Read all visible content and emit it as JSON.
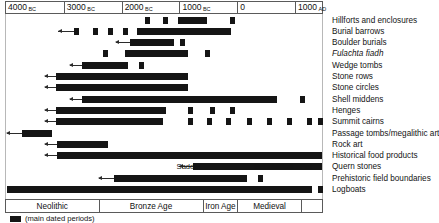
{
  "chart_data": {
    "type": "bar",
    "xlabel": "",
    "ylabel": "",
    "orientation": "horizontal-timeline",
    "grid": false,
    "legend_position": "bottom-left",
    "xlim": [
      -4000,
      1500
    ],
    "axis": {
      "ticks": [
        {
          "label": "4000",
          "era": "BC",
          "value": -4000
        },
        {
          "label": "3000",
          "era": "BC",
          "value": -3000
        },
        {
          "label": "2000",
          "era": "BC",
          "value": -2000
        },
        {
          "label": "1000",
          "era": "BC",
          "value": -1000
        },
        {
          "label": "0",
          "era": "",
          "value": 0
        },
        {
          "label": "1000",
          "era": "AD",
          "value": 1000
        }
      ]
    },
    "legend": [
      {
        "swatch": "solid-black",
        "label": "(main dated periods)"
      }
    ],
    "periods": [
      {
        "label": "Neolithic",
        "start": -4000,
        "end": -2400
      },
      {
        "label": "Bronze Age",
        "start": -2400,
        "end": -600
      },
      {
        "label": "Iron Age",
        "start": -600,
        "end": 0
      },
      {
        "label": "Medieval",
        "start": 0,
        "end": 1100
      },
      {
        "label": "",
        "start": 1100,
        "end": 1500
      }
    ],
    "annotations": [
      {
        "text": "Saddle",
        "value": -1050,
        "row": 13
      },
      {
        "text": "Beehive",
        "value": 300,
        "row": 13
      },
      {
        "text": "Disc",
        "value": 680,
        "row": 13
      },
      {
        "text": "&",
        "value": 880,
        "row": 13
      },
      {
        "text": "Pot",
        "value": 1090,
        "row": 13
      }
    ],
    "categories": [
      "Hillforts and enclosures",
      "Burial barrows",
      "Boulder burials",
      "Fulachta fiadh",
      "Wedge tombs",
      "Stone rows",
      "Stone circles",
      "Shell middens",
      "Henges",
      "Summit cairns",
      "Passage tombs/megalithic art",
      "Rock art",
      "Historical food products",
      "Quern stones",
      "Prehistoric field boundaries",
      "Logboats"
    ],
    "rows": [
      {
        "label": "Hillforts and enclosures",
        "italic": false,
        "open_start": false,
        "segments": [
          {
            "start": -1600,
            "end": -1510
          },
          {
            "start": -1290,
            "end": -1200
          },
          {
            "start": -1020,
            "end": -520
          },
          {
            "start": -120,
            "end": -30
          }
        ]
      },
      {
        "label": "Burial barrows",
        "italic": false,
        "open_start": true,
        "arrow_from": -3100,
        "segments": [
          {
            "start": -2830,
            "end": -2740
          },
          {
            "start": -2500,
            "end": -2410
          },
          {
            "start": -2230,
            "end": -2140
          },
          {
            "start": -1970,
            "end": -1880
          },
          {
            "start": -1740,
            "end": -100
          }
        ]
      },
      {
        "label": "Boulder burials",
        "italic": false,
        "open_start": true,
        "arrow_from": -2100,
        "segments": [
          {
            "start": -1850,
            "end": -1090
          },
          {
            "start": -990,
            "end": -900
          }
        ]
      },
      {
        "label": "Fulachta fiadh",
        "italic": true,
        "open_start": false,
        "segments": [
          {
            "start": -2320,
            "end": -2230
          },
          {
            "start": -1950,
            "end": -860
          },
          {
            "start": -560,
            "end": -470
          }
        ]
      },
      {
        "label": "Wedge tombs",
        "italic": false,
        "open_start": true,
        "arrow_from": -2900,
        "segments": [
          {
            "start": -2690,
            "end": -1890
          },
          {
            "start": -1700,
            "end": -1610
          }
        ]
      },
      {
        "label": "Stone rows",
        "italic": false,
        "open_start": true,
        "arrow_from": -3330,
        "segments": [
          {
            "start": -3140,
            "end": -860
          }
        ]
      },
      {
        "label": "Stone circles",
        "italic": false,
        "open_start": true,
        "arrow_from": -3330,
        "segments": [
          {
            "start": -3140,
            "end": -860
          }
        ]
      },
      {
        "label": "Shell middens",
        "italic": false,
        "open_start": true,
        "arrow_from": -2900,
        "segments": [
          {
            "start": -2690,
            "end": 690
          },
          {
            "start": 1080,
            "end": 1170
          }
        ]
      },
      {
        "label": "Henges",
        "italic": false,
        "open_start": true,
        "arrow_from": -3330,
        "segments": [
          {
            "start": -3140,
            "end": -1240
          },
          {
            "start": -850,
            "end": -760
          },
          {
            "start": -480,
            "end": -390
          },
          {
            "start": -120,
            "end": -30
          }
        ]
      },
      {
        "label": "Summit cairns",
        "italic": false,
        "open_start": true,
        "arrow_from": -3330,
        "segments": [
          {
            "start": -3140,
            "end": -1280
          },
          {
            "start": -860,
            "end": -770
          },
          {
            "start": -520,
            "end": -430
          },
          {
            "start": -190,
            "end": -100
          },
          {
            "start": 160,
            "end": 250
          },
          {
            "start": 510,
            "end": 600
          },
          {
            "start": 860,
            "end": 950
          },
          {
            "start": 1200,
            "end": 1290
          },
          {
            "start": 1400,
            "end": 1490
          }
        ]
      },
      {
        "label": "Passage tombs/megalithic art",
        "italic": false,
        "open_start": true,
        "arrow_from": -3990,
        "segments": [
          {
            "start": -3720,
            "end": -3210
          }
        ]
      },
      {
        "label": "Rock art",
        "italic": false,
        "open_start": true,
        "arrow_from": -3330,
        "segments": [
          {
            "start": -3110,
            "end": -2240
          }
        ]
      },
      {
        "label": "Historical food products",
        "italic": false,
        "open_start": true,
        "arrow_from": -3330,
        "segments": [
          {
            "start": -3110,
            "end": 1460
          }
        ]
      },
      {
        "label": "Quern stones",
        "italic": false,
        "open_start": true,
        "arrow_from": -1000,
        "segments": [
          {
            "start": -770,
            "end": 1460
          }
        ]
      },
      {
        "label": "Prehistoric field boundaries",
        "italic": false,
        "open_start": true,
        "arrow_from": -2400,
        "segments": [
          {
            "start": -2130,
            "end": 160
          },
          {
            "start": 350,
            "end": 440
          }
        ]
      },
      {
        "label": "Logboats",
        "italic": false,
        "open_start": false,
        "segments": [
          {
            "start": -3990,
            "end": 1300
          },
          {
            "start": 1390,
            "end": 1480
          }
        ]
      }
    ]
  }
}
